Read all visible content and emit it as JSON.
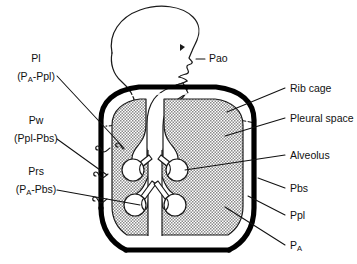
{
  "figure": {
    "background_color": "#ffffff",
    "ink_color": "#111111",
    "lung_fill_color": "#c9c9c9",
    "rib_cage_color": "#000000",
    "pleural_space_color": "#ffffff"
  },
  "labels_left": [
    {
      "id": "pl",
      "name": "Pl",
      "formula": "(PA-Ppl)",
      "formula_prefix": "(P",
      "formula_subscript": "A",
      "formula_suffix": "-Ppl)",
      "meaning": "transpulmonary pressure"
    },
    {
      "id": "pw",
      "name": "Pw",
      "formula": "(Ppl-Pbs)",
      "formula_prefix": "(Ppl-Pbs)",
      "formula_subscript": "",
      "formula_suffix": "",
      "meaning": "transmural pressure of chest wall"
    },
    {
      "id": "prs",
      "name": "Prs",
      "formula": "(PA-Pbs)",
      "formula_prefix": "(P",
      "formula_subscript": "A",
      "formula_suffix": "-Pbs)",
      "meaning": "transrespiratory system pressure"
    }
  ],
  "labels_right": [
    {
      "id": "rib-cage",
      "text": "Rib cage",
      "subscript": ""
    },
    {
      "id": "pleural-space",
      "text": "Pleural space",
      "subscript": ""
    },
    {
      "id": "alveolus",
      "text": "Alveolus",
      "subscript": ""
    },
    {
      "id": "pbs",
      "text": "Pbs",
      "subscript": ""
    },
    {
      "id": "ppl",
      "text": "Ppl",
      "subscript": ""
    },
    {
      "id": "pa",
      "text": "P",
      "subscript": "A"
    }
  ],
  "label_airway_opening": {
    "id": "pao",
    "text": "Pao",
    "meaning": "pressure at airway opening"
  }
}
